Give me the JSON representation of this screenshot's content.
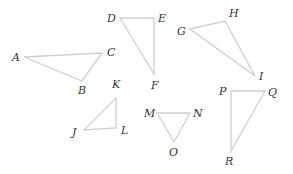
{
  "diagram": {
    "type": "triangles",
    "line_color": "#cfcfcf",
    "label_color": "#333333",
    "triangles": [
      {
        "name": "ABC",
        "vertices": [
          {
            "label": "A",
            "x": 24,
            "y": 57,
            "lx": 12,
            "ly": 61
          },
          {
            "label": "B",
            "x": 82,
            "y": 81,
            "lx": 78,
            "ly": 94
          },
          {
            "label": "C",
            "x": 102,
            "y": 53,
            "lx": 107,
            "ly": 56
          }
        ]
      },
      {
        "name": "DEF",
        "vertices": [
          {
            "label": "D",
            "x": 120,
            "y": 18,
            "lx": 107,
            "ly": 22
          },
          {
            "label": "E",
            "x": 154,
            "y": 18,
            "lx": 158,
            "ly": 22
          },
          {
            "label": "F",
            "x": 154,
            "y": 74,
            "lx": 151,
            "ly": 89
          }
        ]
      },
      {
        "name": "GHI",
        "vertices": [
          {
            "label": "G",
            "x": 190,
            "y": 29,
            "lx": 177,
            "ly": 35
          },
          {
            "label": "H",
            "x": 225,
            "y": 21,
            "lx": 229,
            "ly": 17
          },
          {
            "label": "I",
            "x": 255,
            "y": 76,
            "lx": 259,
            "ly": 80
          }
        ]
      },
      {
        "name": "JKL",
        "vertices": [
          {
            "label": "J",
            "x": 84,
            "y": 130,
            "lx": 72,
            "ly": 136
          },
          {
            "label": "K",
            "x": 116,
            "y": 98,
            "lx": 112,
            "ly": 88
          },
          {
            "label": "L",
            "x": 116,
            "y": 128,
            "lx": 121,
            "ly": 134
          }
        ]
      },
      {
        "name": "MNO",
        "vertices": [
          {
            "label": "M",
            "x": 157,
            "y": 113,
            "lx": 144,
            "ly": 117
          },
          {
            "label": "N",
            "x": 190,
            "y": 113,
            "lx": 193,
            "ly": 117
          },
          {
            "label": "O",
            "x": 174,
            "y": 142,
            "lx": 169,
            "ly": 156
          }
        ]
      },
      {
        "name": "PQR",
        "vertices": [
          {
            "label": "P",
            "x": 231,
            "y": 91,
            "lx": 219,
            "ly": 95
          },
          {
            "label": "Q",
            "x": 265,
            "y": 91,
            "lx": 268,
            "ly": 96
          },
          {
            "label": "R",
            "x": 231,
            "y": 151,
            "lx": 225,
            "ly": 165
          }
        ]
      }
    ]
  }
}
